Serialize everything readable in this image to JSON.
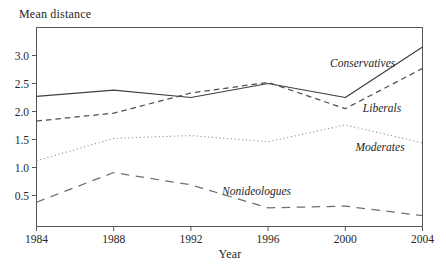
{
  "figure": {
    "background": "#ffffff",
    "frame_color": "#555555",
    "text_color": "#262626"
  },
  "chart_data": {
    "type": "line",
    "title": "",
    "ylabel": "Mean distance",
    "xlabel": "Year",
    "grid": false,
    "legend": "inline-annotations",
    "xlim": [
      1984,
      2004
    ],
    "ylim": [
      0,
      3.5
    ],
    "x": [
      1984,
      1988,
      1992,
      1996,
      2000,
      2004
    ],
    "x_tick_labels": [
      "1984",
      "1988",
      "1992",
      "1996",
      "2000",
      "2004"
    ],
    "y_ticks": [
      0.5,
      1.0,
      1.5,
      2.0,
      2.5,
      3.0
    ],
    "y_tick_labels": [
      "0.5",
      "1.0",
      "1.5",
      "2.0",
      "2.5",
      "3.0"
    ],
    "series": [
      {
        "name": "Conservatives",
        "style": "solid",
        "color": "#3f3f3f",
        "values": [
          2.27,
          2.38,
          2.25,
          2.5,
          2.25,
          3.15
        ]
      },
      {
        "name": "Liberals",
        "style": "dashed",
        "color": "#4f4f4f",
        "values": [
          1.83,
          1.97,
          2.33,
          2.52,
          2.05,
          2.77
        ]
      },
      {
        "name": "Moderates",
        "style": "dotted",
        "color": "#969696",
        "values": [
          1.12,
          1.52,
          1.57,
          1.46,
          1.76,
          1.44
        ]
      },
      {
        "name": "Nonideologues",
        "style": "longdash",
        "color": "#6e6e6e",
        "values": [
          0.38,
          0.91,
          0.69,
          0.28,
          0.31,
          0.14
        ]
      }
    ],
    "annotations": [
      {
        "text": "Conservatives",
        "x": 2000.9,
        "y": 2.87
      },
      {
        "text": "Liberals",
        "x": 2001.9,
        "y": 2.06
      },
      {
        "text": "Moderates",
        "x": 2001.8,
        "y": 1.37
      },
      {
        "text": "Nonideologues",
        "x": 1995.4,
        "y": 0.58
      }
    ]
  }
}
